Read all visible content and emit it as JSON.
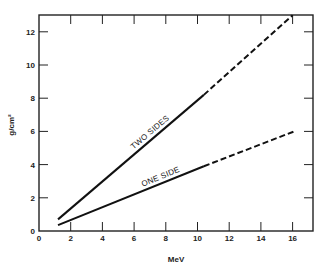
{
  "chart_data": {
    "type": "line",
    "title": "",
    "xlabel": "MeV",
    "ylabel": "g/cm²",
    "xlim": [
      0,
      17
    ],
    "ylim": [
      0,
      13
    ],
    "xticks": [
      0,
      2,
      4,
      6,
      8,
      10,
      12,
      14,
      16
    ],
    "yticks": [
      0,
      2,
      4,
      6,
      8,
      10,
      12
    ],
    "grid": false,
    "legend": "inline labels on lines",
    "series": [
      {
        "name": "TWO SIDES",
        "solid": {
          "x": [
            1.2,
            10.4
          ],
          "y": [
            0.7,
            8.2
          ]
        },
        "dashed": {
          "x": [
            10.4,
            16.0
          ],
          "y": [
            8.2,
            13.0
          ]
        }
      },
      {
        "name": "ONE SIDE",
        "solid": {
          "x": [
            1.2,
            10.4
          ],
          "y": [
            0.35,
            3.9
          ]
        },
        "dashed": {
          "x": [
            10.4,
            16.1
          ],
          "y": [
            3.9,
            6.0
          ]
        }
      }
    ]
  }
}
